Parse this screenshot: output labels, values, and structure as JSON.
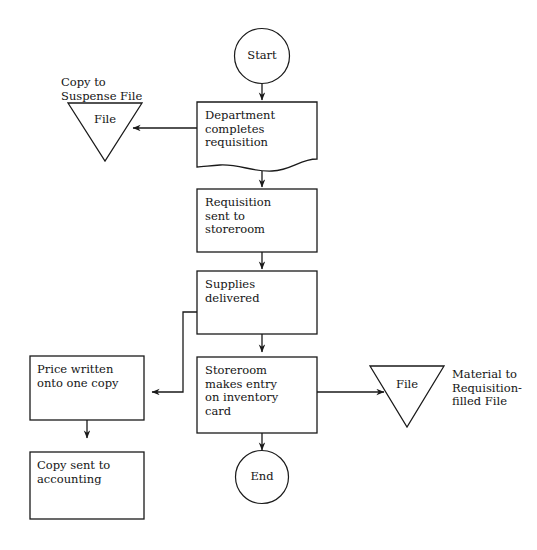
{
  "diagram": {
    "background_color": "#ffffff",
    "line_color": "#1a1a1a",
    "text_color": "#141414",
    "nodes": {
      "start": {
        "label": "Start",
        "shape": "circle"
      },
      "department_completes_requisition": {
        "label": "Department\ncompletes\nrequisition",
        "shape": "document"
      },
      "suspense_file": {
        "label": "File",
        "shape": "triangle"
      },
      "suspense_file_annotation": {
        "label": "Copy to\nSuspense File"
      },
      "requisition_sent_to_storeroom": {
        "label": "Requisition\nsent to\nstoreroom",
        "shape": "rectangle"
      },
      "supplies_delivered": {
        "label": "Supplies\ndelivered",
        "shape": "rectangle"
      },
      "storeroom_makes_entry": {
        "label": "Storeroom\nmakes entry\non inventory\ncard",
        "shape": "rectangle"
      },
      "price_written": {
        "label": "Price written\nonto one copy",
        "shape": "rectangle"
      },
      "copy_sent_to_accounting": {
        "label": "Copy sent to\naccounting",
        "shape": "rectangle"
      },
      "requisition_filled_file": {
        "label": "File",
        "shape": "triangle"
      },
      "requisition_filled_annotation": {
        "label": "Material to\nRequisition-\nfilled File"
      },
      "end": {
        "label": "End",
        "shape": "circle"
      }
    },
    "edges": [
      {
        "from": "start",
        "to": "department_completes_requisition",
        "direction": "down"
      },
      {
        "from": "department_completes_requisition",
        "to": "suspense_file",
        "direction": "left"
      },
      {
        "from": "department_completes_requisition",
        "to": "requisition_sent_to_storeroom",
        "direction": "down"
      },
      {
        "from": "requisition_sent_to_storeroom",
        "to": "supplies_delivered",
        "direction": "down"
      },
      {
        "from": "supplies_delivered",
        "to": "price_written",
        "direction": "left-elbow"
      },
      {
        "from": "supplies_delivered",
        "to": "storeroom_makes_entry",
        "direction": "down"
      },
      {
        "from": "storeroom_makes_entry",
        "to": "requisition_filled_file",
        "direction": "right"
      },
      {
        "from": "storeroom_makes_entry",
        "to": "end",
        "direction": "down"
      },
      {
        "from": "price_written",
        "to": "copy_sent_to_accounting",
        "direction": "down"
      }
    ]
  }
}
